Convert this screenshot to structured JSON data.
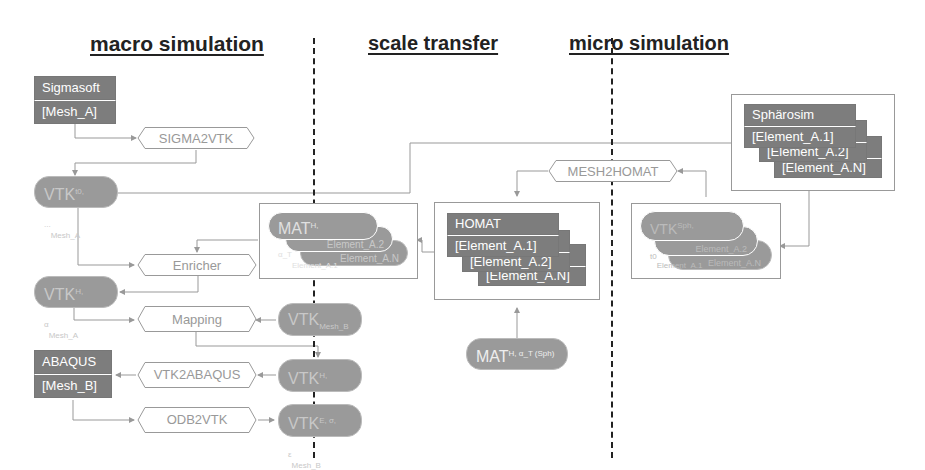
{
  "headings": {
    "macro": "macro simulation",
    "transfer": "scale transfer",
    "micro": "micro simulation"
  },
  "macro": {
    "sigmasoft": {
      "title": "Sigmasoft",
      "mesh": "[Mesh_A]"
    },
    "sigma2vtk": "SIGMA2VTK",
    "vtk_mesh_a_1": {
      "base": "VTK",
      "sup": "t0, ...",
      "sub": "Mesh_A"
    },
    "enricher": "Enricher",
    "vtk_mesh_a_2": {
      "base": "VTK",
      "sup": "H, α",
      "sub": "Mesh_A"
    },
    "mapping": "Mapping",
    "vtk_mesh_b_1": {
      "base": "VTK",
      "sup": "",
      "sub": "Mesh_B"
    },
    "abaqus": {
      "title": "ABAQUS",
      "mesh": "[Mesh_B]"
    },
    "vtk2abaqus": "VTK2ABAQUS",
    "vtk_mesh_b_2": {
      "base": "VTK",
      "sup": "H, α",
      "sub": "Mesh_B"
    },
    "odb2vtk": "ODB2VTK",
    "vtk_mesh_b_3": {
      "base": "VTK",
      "sup": "E, σ, ε",
      "sub": "Mesh_B"
    },
    "mat_stack": {
      "base": "MAT",
      "sup": "H, α_T",
      "items": [
        "Element_A.1",
        "Element_A.2",
        "Element_A.N"
      ]
    }
  },
  "transfer": {
    "mesh2homat": "MESH2HOMAT",
    "homat": {
      "title": "HOMAT",
      "items": [
        "[Element_A.1]",
        "[Element_A.2]",
        "[Element_A.N]"
      ]
    },
    "mat_sph": {
      "base": "MAT",
      "sup": "H, α_T (Sph)"
    }
  },
  "micro": {
    "spharosim": {
      "title": "Sphärosim",
      "items": [
        "[Element_A.1]",
        "[Element_A.2]",
        "[Element_A.N]"
      ]
    },
    "vtk_stack": {
      "base": "VTK",
      "sup": "Sph, t0",
      "items": [
        "Element_A.1",
        "Element_A.2",
        "Element_A.N"
      ]
    }
  }
}
